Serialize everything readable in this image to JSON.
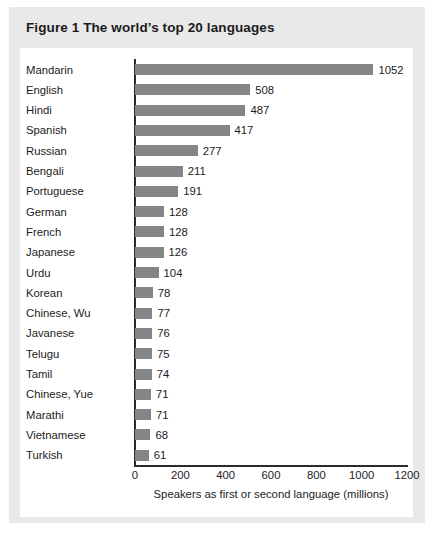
{
  "figure": {
    "title": "Figure 1 The world’s top 20 languages"
  },
  "colors": {
    "bar": "#858585",
    "axis": "#2b2b2b",
    "panel": "#e9e9e9",
    "card": "#ffffff",
    "text": "#1c1c1c"
  },
  "chart_data": {
    "type": "bar",
    "orientation": "horizontal",
    "title": "Figure 1 The world’s top 20 languages",
    "xlabel": "Speakers as first or second language (millions)",
    "ylabel": "",
    "xlim": [
      0,
      1200
    ],
    "xticks": [
      0,
      200,
      400,
      600,
      800,
      1000,
      1200
    ],
    "xtick_labels": [
      "0",
      "200",
      "400",
      "600",
      "800",
      "1000",
      "1200"
    ],
    "grid": false,
    "legend": null,
    "show_value_labels": true,
    "categories": [
      "Mandarin",
      "English",
      "Hindi",
      "Spanish",
      "Russian",
      "Bengali",
      "Portuguese",
      "German",
      "French",
      "Japanese",
      "Urdu",
      "Korean",
      "Chinese, Wu",
      "Javanese",
      "Telugu",
      "Tamil",
      "Chinese, Yue",
      "Marathi",
      "Vietnamese",
      "Turkish"
    ],
    "values": [
      1052,
      508,
      487,
      417,
      277,
      211,
      191,
      128,
      128,
      126,
      104,
      78,
      77,
      76,
      75,
      74,
      71,
      71,
      68,
      61
    ],
    "value_labels": [
      "1052",
      "508",
      "487",
      "417",
      "277",
      "211",
      "191",
      "128",
      "128",
      "126",
      "104",
      "78",
      "77",
      "76",
      "75",
      "74",
      "71",
      "71",
      "68",
      "61"
    ]
  }
}
